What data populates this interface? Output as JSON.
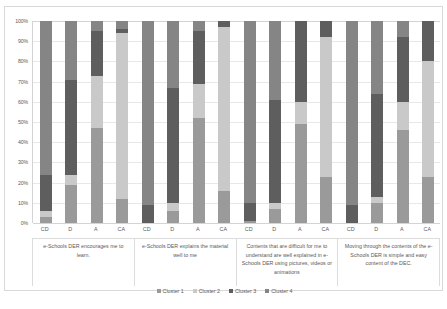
{
  "chart_data": {
    "type": "bar",
    "subtype": "100% stacked column",
    "title": "",
    "xlabel": "",
    "ylabel": "",
    "ylim": [
      0,
      100
    ],
    "grid": true,
    "legend_position": "bottom",
    "ytick_labels": [
      "0%",
      "10%",
      "20%",
      "30%",
      "40%",
      "50%",
      "60%",
      "70%",
      "80%",
      "90%",
      "100%"
    ],
    "ytick_values": [
      0,
      10,
      20,
      30,
      40,
      50,
      60,
      70,
      80,
      90,
      100
    ],
    "response_categories": [
      "CD",
      "D",
      "A",
      "CA"
    ],
    "series": [
      {
        "name": "Cluster 1",
        "color": "#9a9a9a"
      },
      {
        "name": "Cluster 2",
        "color": "#c9c9c9"
      },
      {
        "name": "Cluster 3",
        "color": "#5e5e5e"
      },
      {
        "name": "Cluster 4",
        "color": "#858585"
      }
    ],
    "groups": [
      {
        "label": "e-Schools DER encourages me to learn.",
        "bars": [
          {
            "x": "CD",
            "values": [
              3,
              3,
              18,
              76
            ]
          },
          {
            "x": "D",
            "values": [
              19,
              5,
              47,
              29
            ]
          },
          {
            "x": "A",
            "values": [
              47,
              26,
              22,
              5
            ]
          },
          {
            "x": "CA",
            "values": [
              12,
              82,
              2,
              4
            ]
          }
        ]
      },
      {
        "label": "e-Schools DER explains the material well to me",
        "bars": [
          {
            "x": "CD",
            "values": [
              0,
              0,
              9,
              91
            ]
          },
          {
            "x": "D",
            "values": [
              6,
              4,
              57,
              33
            ]
          },
          {
            "x": "A",
            "values": [
              52,
              17,
              26,
              5
            ]
          },
          {
            "x": "CA",
            "values": [
              16,
              81,
              3,
              0
            ]
          }
        ]
      },
      {
        "label": "Contents that are difficult for me to understand are well explained in e-Schools DER using pictures, videos or animations",
        "bars": [
          {
            "x": "CD",
            "values": [
              1,
              0,
              9,
              90
            ]
          },
          {
            "x": "D",
            "values": [
              7,
              3,
              51,
              39
            ]
          },
          {
            "x": "A",
            "values": [
              49,
              11,
              40,
              0
            ]
          },
          {
            "x": "CA",
            "values": [
              23,
              69,
              8,
              0
            ]
          }
        ]
      },
      {
        "label": "Moving through the contents of the e-Schools DER is simple and easy content of the DEC.",
        "bars": [
          {
            "x": "CD",
            "values": [
              0,
              0,
              9,
              91
            ]
          },
          {
            "x": "D",
            "values": [
              10,
              3,
              51,
              36
            ]
          },
          {
            "x": "A",
            "values": [
              46,
              14,
              32,
              8
            ]
          },
          {
            "x": "CA",
            "values": [
              23,
              57,
              20,
              0
            ]
          }
        ]
      }
    ]
  },
  "legend": {
    "items": [
      {
        "label": "Cluster 1",
        "color": "#9a9a9a"
      },
      {
        "label": "Cluster 2",
        "color": "#c9c9c9"
      },
      {
        "label": "Cluster 3",
        "color": "#5e5e5e"
      },
      {
        "label": "Cluster 4",
        "color": "#858585"
      }
    ]
  },
  "caption": {
    "text": ""
  }
}
